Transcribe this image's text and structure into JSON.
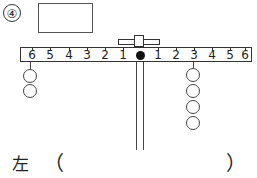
{
  "question": {
    "number": "④"
  },
  "answer_box": {
    "value": ""
  },
  "lever": {
    "left_labels": [
      "6",
      "5",
      "4",
      "3",
      "2",
      "1"
    ],
    "right_labels": [
      "1",
      "2",
      "3",
      "4",
      "5",
      "6"
    ],
    "left_weights": {
      "position": 6,
      "count": 2
    },
    "right_weights": {
      "position": 3,
      "count": 4
    }
  },
  "answer": {
    "label": "左",
    "open_paren": "（",
    "close_paren": "）",
    "value": ""
  }
}
